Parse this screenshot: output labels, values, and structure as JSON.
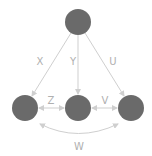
{
  "diagram": {
    "colors": {
      "node": "#6a6a6a",
      "edge": "#cfcfcf",
      "label": "#b0b0b0",
      "background": "#ffffff"
    },
    "nodes": [
      {
        "id": "top",
        "cx": 78,
        "cy": 22,
        "r": 13
      },
      {
        "id": "left",
        "cx": 25,
        "cy": 108,
        "r": 13
      },
      {
        "id": "middle",
        "cx": 78,
        "cy": 108,
        "r": 13
      },
      {
        "id": "right",
        "cx": 131,
        "cy": 108,
        "r": 13
      }
    ],
    "edges": [
      {
        "from": "top",
        "to": "left",
        "label": "X",
        "type": "arrow"
      },
      {
        "from": "top",
        "to": "middle",
        "label": "Y",
        "type": "arrow"
      },
      {
        "from": "top",
        "to": "right",
        "label": "U",
        "type": "arrow"
      },
      {
        "from": "left",
        "to": "middle",
        "label": "Z",
        "type": "bidirectional"
      },
      {
        "from": "middle",
        "to": "right",
        "label": "V",
        "type": "bidirectional"
      },
      {
        "from": "left",
        "to": "right",
        "label": "W",
        "type": "bidirectional-curved"
      }
    ],
    "labels": {
      "x": "X",
      "y": "Y",
      "u": "U",
      "z": "Z",
      "v": "V",
      "w": "W"
    }
  }
}
